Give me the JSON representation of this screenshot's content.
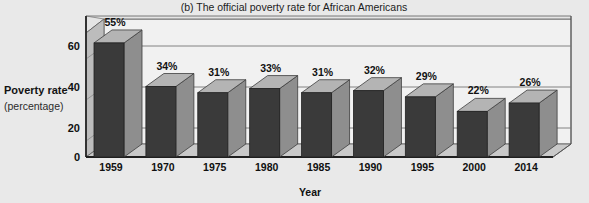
{
  "chart_data": {
    "type": "bar",
    "title": "(b) The official poverty rate for African Americans",
    "xlabel": "Year",
    "ylabel": "Poverty rate",
    "ylabel_sub": "(percentage)",
    "categories": [
      "1959",
      "1970",
      "1975",
      "1980",
      "1985",
      "1990",
      "1995",
      "2000",
      "2014"
    ],
    "values": [
      55,
      34,
      31,
      33,
      31,
      32,
      29,
      22,
      26
    ],
    "value_labels": [
      "55%",
      "34%",
      "31%",
      "33%",
      "31%",
      "32%",
      "29%",
      "22%",
      "26%"
    ],
    "yticks": [
      0,
      20,
      40,
      60
    ],
    "ytick_labels": [
      "0",
      "20",
      "40",
      "60"
    ],
    "ylim": [
      0,
      68
    ],
    "grid": true,
    "legend": "none",
    "style": "3d-column",
    "colors": {
      "background": "#e9e9e9",
      "plot_floor": "#c9c9c9",
      "plot_wall": "#f1f1f1",
      "side_wall": "#bcbcbc",
      "bar_front": "#3a3a3a",
      "bar_top": "#b4b4b4",
      "bar_side": "#8e8e8e",
      "frame_line": "#4a4a4a",
      "grid_line": "#6f6f6f",
      "text": "#111111"
    }
  }
}
